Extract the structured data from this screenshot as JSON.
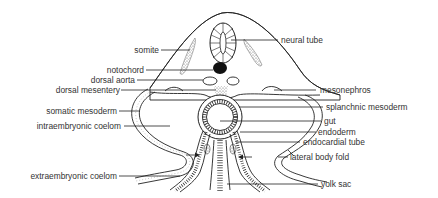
{
  "diagram": {
    "labels_left": {
      "somite": "somite",
      "notochord": "notochord",
      "dorsal_aorta": "dorsal aorta",
      "dorsal_mesentery": "dorsal mesentery",
      "somatic_mesoderm": "somatic mesoderm",
      "intraembryonic_coelom": "intraembryonic coelom",
      "extraembryonic_coelom": "extraembryonic coelom"
    },
    "labels_right": {
      "neural_tube": "neural tube",
      "mesonephros": "mesonephros",
      "splanchnic_mesoderm": "splanchnic mesoderm",
      "gut": "gut",
      "endoderm": "endoderm",
      "endocardial_tube": "endocardial tube",
      "lateral_body_fold": "lateral body fold",
      "yolk_sac": "yolk sac"
    },
    "colors": {
      "line": "#222222",
      "text": "#333333",
      "stipple": "#777777",
      "background": "#ffffff"
    }
  }
}
